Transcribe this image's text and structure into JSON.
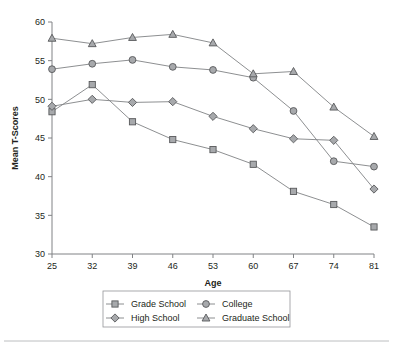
{
  "chart_data": {
    "type": "line",
    "title": "",
    "xlabel": "Age",
    "ylabel": "Mean T-Scores",
    "categories": [
      25,
      32,
      39,
      46,
      53,
      60,
      67,
      74,
      81
    ],
    "x": [
      25,
      32,
      39,
      46,
      53,
      60,
      67,
      74,
      81
    ],
    "xtick_labels": [
      "25",
      "32",
      "39",
      "46",
      "53",
      "60",
      "67",
      "74",
      "81"
    ],
    "ytick_labels": [
      "30",
      "35",
      "40",
      "45",
      "50",
      "55",
      "60"
    ],
    "yticks": [
      30,
      35,
      40,
      45,
      50,
      55,
      60
    ],
    "ylim": [
      30,
      60
    ],
    "xlim": [
      25,
      81
    ],
    "grid": false,
    "legend_position": "bottom",
    "series": [
      {
        "name": "Grade School",
        "marker": "square",
        "values": [
          48.4,
          51.9,
          47.1,
          44.8,
          43.5,
          41.6,
          38.1,
          36.4,
          33.5
        ]
      },
      {
        "name": "High School",
        "marker": "diamond",
        "values": [
          49.1,
          50.0,
          49.6,
          49.7,
          47.8,
          46.2,
          44.9,
          44.7,
          38.4
        ]
      },
      {
        "name": "College",
        "marker": "circle",
        "values": [
          53.9,
          54.6,
          55.1,
          54.2,
          53.8,
          52.8,
          48.5,
          42.0,
          41.3
        ]
      },
      {
        "name": "Graduate School",
        "marker": "triangle",
        "values": [
          57.9,
          57.2,
          58.0,
          58.4,
          57.3,
          53.3,
          53.6,
          49.0,
          45.2
        ]
      }
    ],
    "colors": {
      "line": "#808285",
      "marker_fill": "#a7a9ac",
      "marker_stroke": "#58595b",
      "axis": "#808285",
      "text": "#231f20",
      "background": "#ffffff"
    }
  },
  "legend": {
    "items": [
      {
        "label": "Grade School",
        "marker": "square"
      },
      {
        "label": "College",
        "marker": "circle"
      },
      {
        "label": "High School",
        "marker": "diamond"
      },
      {
        "label": "Graduate School",
        "marker": "triangle"
      }
    ]
  }
}
